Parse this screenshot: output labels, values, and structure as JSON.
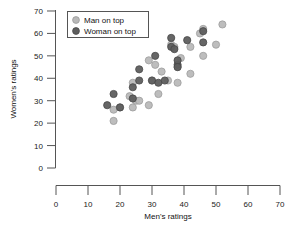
{
  "chart_data": {
    "type": "scatter",
    "title": "",
    "xlabel": "Men's ratings",
    "ylabel": "Women's ratings",
    "xlim": [
      0,
      70
    ],
    "ylim": [
      0,
      70
    ],
    "xticks": [
      0,
      10,
      20,
      30,
      40,
      50,
      60,
      70
    ],
    "yticks": [
      0,
      10,
      20,
      30,
      40,
      50,
      60,
      70
    ],
    "grid": false,
    "legend_position": "top-left",
    "colors": {
      "man_on_top": "#b9b9b9",
      "woman_on_top": "#5e5e5e",
      "axis": "#555555",
      "background": "#ffffff"
    },
    "series": [
      {
        "name": "Man on top",
        "marker": "circle-light",
        "color": "#b9b9b9",
        "points": [
          [
            18,
            26
          ],
          [
            18,
            21
          ],
          [
            20,
            27
          ],
          [
            23,
            32
          ],
          [
            24,
            27
          ],
          [
            24,
            38
          ],
          [
            25,
            30
          ],
          [
            26,
            30
          ],
          [
            29,
            28
          ],
          [
            29,
            48
          ],
          [
            30,
            39
          ],
          [
            31,
            46
          ],
          [
            32,
            33
          ],
          [
            33,
            43
          ],
          [
            35,
            39
          ],
          [
            36,
            55
          ],
          [
            37,
            54
          ],
          [
            38,
            38
          ],
          [
            38,
            45
          ],
          [
            39,
            49
          ],
          [
            42,
            42
          ],
          [
            42,
            54
          ],
          [
            45,
            60
          ],
          [
            46,
            50
          ],
          [
            46,
            62
          ],
          [
            50,
            55
          ],
          [
            52,
            64
          ]
        ]
      },
      {
        "name": "Woman on top",
        "marker": "circle-dark",
        "color": "#5e5e5e",
        "points": [
          [
            16,
            28
          ],
          [
            18,
            33
          ],
          [
            20,
            27
          ],
          [
            24,
            31
          ],
          [
            24,
            36
          ],
          [
            26,
            39
          ],
          [
            26,
            44
          ],
          [
            30,
            39
          ],
          [
            31,
            50
          ],
          [
            32,
            38
          ],
          [
            34,
            39
          ],
          [
            36,
            54
          ],
          [
            36,
            58
          ],
          [
            37,
            53
          ],
          [
            38,
            46
          ],
          [
            38,
            48
          ],
          [
            38,
            45
          ],
          [
            41,
            57
          ],
          [
            46,
            56
          ],
          [
            46,
            61
          ]
        ]
      }
    ]
  },
  "legend": {
    "items": [
      {
        "label": "Man on top"
      },
      {
        "label": "Woman on top"
      }
    ]
  },
  "axis": {
    "x_title": "Men's ratings",
    "y_title": "Women's ratings",
    "x_tick_labels": [
      "0",
      "10",
      "20",
      "30",
      "40",
      "50",
      "60",
      "70"
    ],
    "y_tick_labels": [
      "0",
      "10",
      "20",
      "30",
      "40",
      "50",
      "60",
      "70"
    ]
  }
}
